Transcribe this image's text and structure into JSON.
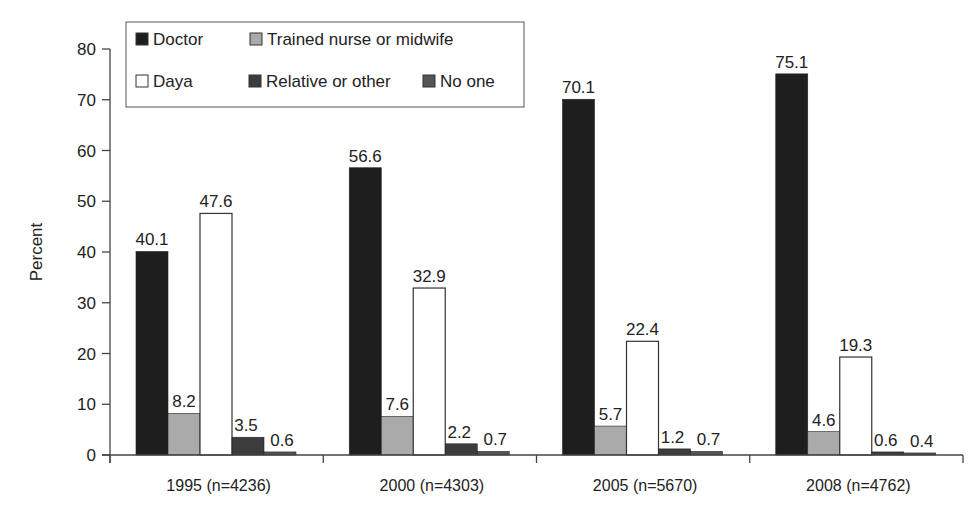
{
  "chart_data": {
    "type": "bar",
    "title": "",
    "xlabel": "",
    "ylabel": "Percent",
    "ylim": [
      0,
      80
    ],
    "yticks": [
      0,
      10,
      20,
      30,
      40,
      50,
      60,
      70,
      80
    ],
    "grid": false,
    "legend_position": "top-left",
    "categories": [
      "1995 (n=4236)",
      "2000 (n=4303)",
      "2005 (n=5670)",
      "2008 (n=4762)"
    ],
    "series": [
      {
        "name": "Doctor",
        "color": "#1e1e1e",
        "values": [
          40.1,
          56.6,
          70.1,
          75.1
        ]
      },
      {
        "name": "Trained nurse or midwife",
        "color": "#aaaaaa",
        "values": [
          8.2,
          7.6,
          5.7,
          4.6
        ]
      },
      {
        "name": "Daya",
        "color": "#ffffff",
        "values": [
          47.6,
          32.9,
          22.4,
          19.3
        ]
      },
      {
        "name": "Relative or other",
        "color": "#3c3c3c",
        "values": [
          3.5,
          2.2,
          1.2,
          0.6
        ]
      },
      {
        "name": "No one",
        "color": "#555555",
        "values": [
          0.6,
          0.7,
          0.7,
          0.4
        ]
      }
    ],
    "legend_rows": [
      [
        "Doctor",
        "Trained nurse or midwife"
      ],
      [
        "Daya",
        "Relative or other",
        "No one"
      ]
    ]
  }
}
